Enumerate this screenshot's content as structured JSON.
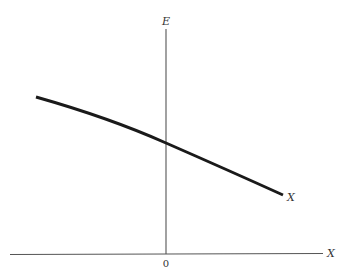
{
  "diagram": {
    "vertical_axis_label": "E",
    "horizontal_axis_label": "X",
    "origin_label": "0",
    "curve_label": "X",
    "curve_description": "gently decreasing, slightly concave-down line crossing the E axis above the origin",
    "colors": {
      "background": "#ffffff",
      "axis": "#555555",
      "curve": "#1a1a1a",
      "text": "#333333"
    }
  }
}
